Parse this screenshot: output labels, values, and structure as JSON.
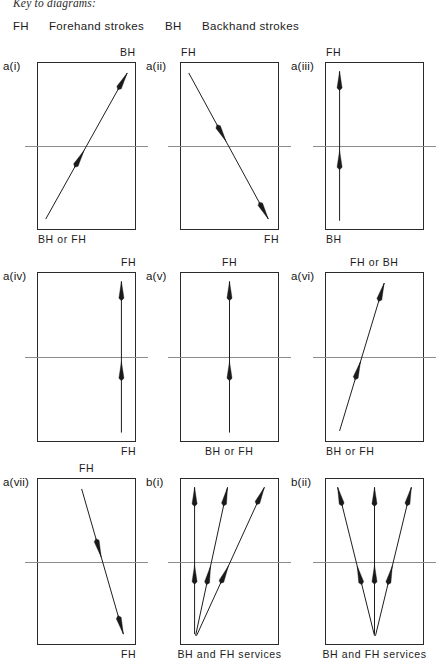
{
  "header": {
    "key_title": "Key to diagrams:",
    "fh_abbr": "FH",
    "fh_text": "Forehand strokes",
    "bh_abbr": "BH",
    "bh_text": "Backhand strokes"
  },
  "diagrams": [
    {
      "id": "a-i",
      "label": "a(i)",
      "top_caption": "BH",
      "top_caption_align": "right",
      "bottom_caption": "BH or FH",
      "bottom_caption_align": "left",
      "arrows": [
        {
          "name": "stroke-arrow-diagonal-up-right",
          "x1": 8,
          "y1": 94,
          "x2": 92,
          "y2": 6,
          "heads": "both"
        }
      ]
    },
    {
      "id": "a-ii",
      "label": "a(ii)",
      "top_caption": "FH",
      "top_caption_align": "left",
      "bottom_caption": "FH",
      "bottom_caption_align": "right",
      "arrows": [
        {
          "name": "stroke-arrow-diagonal-down-right",
          "x1": 8,
          "y1": 6,
          "x2": 90,
          "y2": 94,
          "heads": "both"
        }
      ]
    },
    {
      "id": "a-iii",
      "label": "a(iii)",
      "top_caption": "FH",
      "top_caption_align": "left",
      "bottom_caption": "BH",
      "bottom_caption_align": "left",
      "arrows": [
        {
          "name": "stroke-arrow-vertical-left",
          "x1": 14,
          "y1": 95,
          "x2": 14,
          "y2": 5,
          "heads": "both"
        }
      ]
    },
    {
      "id": "a-iv",
      "label": "a(iv)",
      "top_caption": "FH",
      "top_caption_align": "right",
      "bottom_caption": "FH",
      "bottom_caption_align": "right",
      "arrows": [
        {
          "name": "stroke-arrow-vertical-right",
          "x1": 86,
          "y1": 95,
          "x2": 86,
          "y2": 5,
          "heads": "both"
        }
      ]
    },
    {
      "id": "a-v",
      "label": "a(v)",
      "top_caption": "FH",
      "top_caption_align": "center",
      "bottom_caption": "BH or FH",
      "bottom_caption_align": "center",
      "arrows": [
        {
          "name": "stroke-arrow-vertical-center",
          "x1": 50,
          "y1": 95,
          "x2": 50,
          "y2": 5,
          "heads": "both"
        }
      ]
    },
    {
      "id": "a-vi",
      "label": "a(vi)",
      "top_caption": "FH or BH",
      "top_caption_align": "center",
      "bottom_caption": "BH or FH",
      "bottom_caption_align": "left",
      "arrows": [
        {
          "name": "stroke-arrow-steep-up-right",
          "x1": 14,
          "y1": 94,
          "x2": 60,
          "y2": 6,
          "heads": "both"
        }
      ]
    },
    {
      "id": "a-vii",
      "label": "a(vii)",
      "top_caption": "FH",
      "top_caption_align": "center",
      "bottom_caption": "FH",
      "bottom_caption_align": "right",
      "arrows": [
        {
          "name": "stroke-arrow-steep-down-right",
          "x1": 45,
          "y1": 6,
          "x2": 88,
          "y2": 94,
          "heads": "both"
        }
      ]
    },
    {
      "id": "b-i",
      "label": "b(i)",
      "top_caption": "",
      "top_caption_align": "center",
      "bottom_caption": "BH and FH services",
      "bottom_caption_align": "center",
      "arrows": [
        {
          "name": "service-arrow-vertical",
          "x1": 14,
          "y1": 94,
          "x2": 14,
          "y2": 5,
          "heads": "both"
        },
        {
          "name": "service-arrow-middle",
          "x1": 15,
          "y1": 95,
          "x2": 48,
          "y2": 5,
          "heads": "both"
        },
        {
          "name": "service-arrow-right",
          "x1": 16,
          "y1": 95,
          "x2": 86,
          "y2": 5,
          "heads": "both"
        }
      ]
    },
    {
      "id": "b-ii",
      "label": "b(ii)",
      "top_caption": "",
      "top_caption_align": "center",
      "bottom_caption": "BH and FH services",
      "bottom_caption_align": "center",
      "arrows": [
        {
          "name": "service-arrow-left",
          "x1": 50,
          "y1": 95,
          "x2": 12,
          "y2": 5,
          "heads": "both"
        },
        {
          "name": "service-arrow-vertical",
          "x1": 50,
          "y1": 94,
          "x2": 50,
          "y2": 5,
          "heads": "both"
        },
        {
          "name": "service-arrow-right",
          "x1": 51,
          "y1": 95,
          "x2": 88,
          "y2": 5,
          "heads": "both"
        }
      ]
    }
  ],
  "layout": {
    "columns_x": [
      37,
      180,
      325
    ],
    "rows_y": [
      62,
      272,
      478
    ],
    "court_width": 99,
    "court_heights": [
      168,
      170,
      167
    ]
  },
  "colors": {
    "court_line": "#2b2b2b",
    "net_line": "#8d8d8d",
    "arrow": "#1a1a1a",
    "text": "#1a1a1a",
    "background": "#ffffff"
  }
}
